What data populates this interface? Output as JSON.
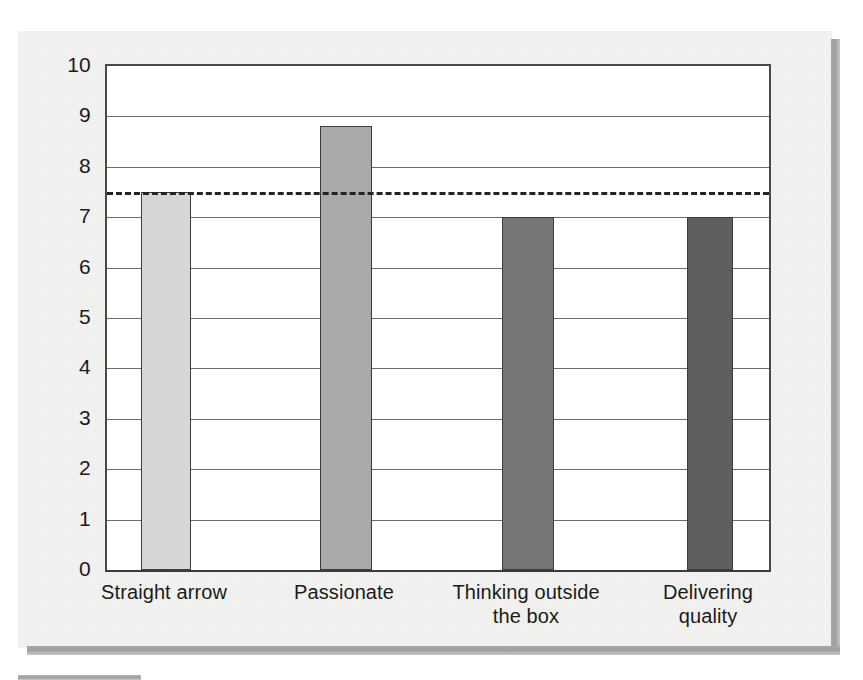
{
  "page": {
    "background_color": "#ffffff",
    "panel_color": "#f1f1f0",
    "shadow_color": "#a3a3a3"
  },
  "chart_data": {
    "type": "bar",
    "title": "",
    "subtitle": "",
    "xlabel": "",
    "ylabel": "",
    "categories": [
      "Straight arrow",
      "Passionate",
      "Thinking outside the box",
      "Delivering quality"
    ],
    "category_lines": [
      [
        "Straight arrow"
      ],
      [
        "Passionate"
      ],
      [
        "Thinking outside",
        "the box"
      ],
      [
        "Delivering",
        "quality"
      ]
    ],
    "values": [
      7.5,
      8.8,
      7.0,
      7.0
    ],
    "bar_colors": [
      "#d6d6d6",
      "#a9a9a9",
      "#767676",
      "#5f5f5f"
    ],
    "ylim": [
      0,
      10
    ],
    "ytick_labels": [
      "10",
      "9",
      "8",
      "7",
      "6",
      "5",
      "4",
      "3",
      "2",
      "1",
      "0"
    ],
    "ytick_values": [
      10,
      9,
      8,
      7,
      6,
      5,
      4,
      3,
      2,
      1,
      0
    ],
    "grid": true,
    "grid_axis": "y",
    "legend": false,
    "legend_position": "none",
    "annotations": [
      {
        "name": "reference-line",
        "type": "hline",
        "value": 7.5,
        "style": "dashed",
        "color": "#232323",
        "label": ""
      }
    ]
  }
}
